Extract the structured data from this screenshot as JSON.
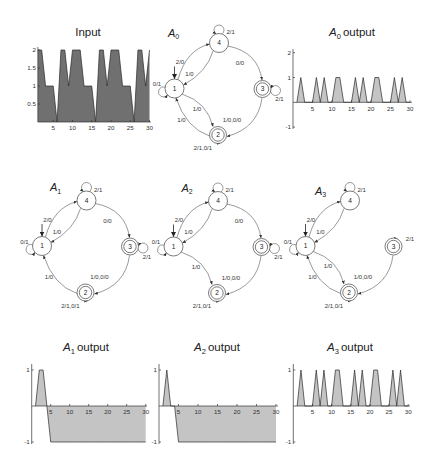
{
  "chart_data": [
    {
      "id": "input",
      "type": "area",
      "title": "Input",
      "title_parts": {
        "text": "Input"
      },
      "xlabel": "",
      "ylabel": "",
      "x": [
        1,
        2,
        3,
        4,
        5,
        6,
        7,
        8,
        9,
        10,
        11,
        12,
        13,
        14,
        15,
        16,
        17,
        18,
        19,
        20,
        21,
        22,
        23,
        24,
        25,
        26,
        27,
        28,
        29,
        30
      ],
      "values": [
        2,
        2,
        1,
        1,
        1,
        0,
        2,
        2,
        1,
        2,
        2,
        2,
        1,
        1,
        1,
        0,
        2,
        2,
        1,
        2,
        2,
        2,
        1,
        1,
        1,
        0,
        2,
        2,
        1,
        2
      ],
      "xlim": [
        1,
        30
      ],
      "ylim": [
        0,
        2
      ],
      "xticks": [
        5,
        10,
        15,
        20,
        25,
        30
      ],
      "xtick_labels": [
        "5",
        "10",
        "15",
        "20",
        "25",
        "30"
      ],
      "yticks": [
        0.5,
        1,
        1.5,
        2
      ],
      "ytick_labels": [
        "0.5",
        "1",
        "1.5",
        "2"
      ],
      "grid": false,
      "fill_color": "#707070"
    },
    {
      "id": "a0-output",
      "type": "area",
      "title": "A0 output",
      "title_parts": {
        "var": "A",
        "sub": "0",
        "text": "output"
      },
      "xlabel": "",
      "ylabel": "",
      "x": [
        1,
        2,
        3,
        4,
        5,
        6,
        7,
        8,
        9,
        10,
        11,
        12,
        13,
        14,
        15,
        16,
        17,
        18,
        19,
        20,
        21,
        22,
        23,
        24,
        25,
        26,
        27,
        28,
        29,
        30
      ],
      "values": [
        0,
        1,
        0,
        0,
        0,
        1,
        0,
        1,
        0,
        0,
        1,
        1,
        0,
        0,
        0,
        1,
        0,
        1,
        0,
        0,
        1,
        1,
        0,
        0,
        0,
        1,
        0,
        1,
        0,
        0
      ],
      "xlim": [
        0,
        30
      ],
      "ylim": [
        -1,
        2
      ],
      "xticks": [
        5,
        10,
        15,
        20,
        25,
        30
      ],
      "xtick_labels": [
        "5",
        "10",
        "15",
        "20",
        "25",
        "30"
      ],
      "yticks": [
        -1,
        1,
        2
      ],
      "ytick_labels": [
        "-1",
        "1",
        "2"
      ],
      "grid": false,
      "fill_color": "#c4c4c4"
    },
    {
      "id": "a1-output",
      "type": "area",
      "title": "A1 output",
      "title_parts": {
        "var": "A",
        "sub": "1",
        "text": "output"
      },
      "xlabel": "",
      "ylabel": "",
      "x": [
        1,
        2,
        3,
        4,
        5,
        6,
        7,
        8,
        9,
        10,
        11,
        12,
        13,
        14,
        15,
        16,
        17,
        18,
        19,
        20,
        21,
        22,
        23,
        24,
        25,
        26,
        27,
        28,
        29,
        30
      ],
      "values": [
        0,
        1,
        1,
        0,
        -1,
        -1,
        -1,
        -1,
        -1,
        -1,
        -1,
        -1,
        -1,
        -1,
        -1,
        -1,
        -1,
        -1,
        -1,
        -1,
        -1,
        -1,
        -1,
        -1,
        -1,
        -1,
        -1,
        -1,
        -1,
        -1
      ],
      "xlim": [
        0,
        30
      ],
      "ylim": [
        -1,
        1
      ],
      "xticks": [
        5,
        10,
        15,
        20,
        25,
        30
      ],
      "xtick_labels": [
        "5",
        "10",
        "15",
        "20",
        "25",
        "30"
      ],
      "yticks": [
        -1,
        1
      ],
      "ytick_labels": [
        "-1",
        "1"
      ],
      "grid": false,
      "fill_color": "#c4c4c4"
    },
    {
      "id": "a2-output",
      "type": "area",
      "title": "A2 output",
      "title_parts": {
        "var": "A",
        "sub": "2",
        "text": "output"
      },
      "xlabel": "",
      "ylabel": "",
      "x": [
        1,
        2,
        3,
        4,
        5,
        6,
        7,
        8,
        9,
        10,
        11,
        12,
        13,
        14,
        15,
        16,
        17,
        18,
        19,
        20,
        21,
        22,
        23,
        24,
        25,
        26,
        27,
        28,
        29,
        30
      ],
      "values": [
        0,
        1,
        0,
        0,
        -1,
        -1,
        -1,
        -1,
        -1,
        -1,
        -1,
        -1,
        -1,
        -1,
        -1,
        -1,
        -1,
        -1,
        -1,
        -1,
        -1,
        -1,
        -1,
        -1,
        -1,
        -1,
        -1,
        -1,
        -1,
        -1
      ],
      "xlim": [
        0,
        30
      ],
      "ylim": [
        -1,
        1
      ],
      "xticks": [
        5,
        10,
        15,
        20,
        25,
        30
      ],
      "xtick_labels": [
        "5",
        "10",
        "15",
        "20",
        "25",
        "30"
      ],
      "yticks": [
        -1,
        1
      ],
      "ytick_labels": [
        "-1",
        "1"
      ],
      "grid": false,
      "fill_color": "#c4c4c4"
    },
    {
      "id": "a3-output",
      "type": "area",
      "title": "A3 output",
      "title_parts": {
        "var": "A",
        "sub": "3",
        "text": "output"
      },
      "xlabel": "",
      "ylabel": "",
      "x": [
        1,
        2,
        3,
        4,
        5,
        6,
        7,
        8,
        9,
        10,
        11,
        12,
        13,
        14,
        15,
        16,
        17,
        18,
        19,
        20,
        21,
        22,
        23,
        24,
        25,
        26,
        27,
        28,
        29,
        30
      ],
      "values": [
        0,
        1,
        0,
        0,
        0,
        1,
        0,
        1,
        0,
        0,
        1,
        1,
        0,
        0,
        0,
        1,
        0,
        1,
        0,
        0,
        1,
        1,
        0,
        0,
        0,
        1,
        0,
        1,
        0,
        0
      ],
      "xlim": [
        0,
        30
      ],
      "ylim": [
        -1,
        1
      ],
      "xticks": [
        5,
        10,
        15,
        20,
        25,
        30
      ],
      "xtick_labels": [
        "5",
        "10",
        "15",
        "20",
        "25",
        "30"
      ],
      "yticks": [
        -1,
        1
      ],
      "ytick_labels": [
        "-1",
        "1"
      ],
      "grid": false,
      "fill_color": "#c4c4c4"
    }
  ],
  "diagrams": [
    {
      "name": "A0",
      "label": {
        "var": "A",
        "sub": "0"
      },
      "states": [
        {
          "id": "1",
          "initial": true,
          "accepting": false
        },
        {
          "id": "2",
          "initial": false,
          "accepting": true
        },
        {
          "id": "3",
          "initial": false,
          "accepting": true
        },
        {
          "id": "4",
          "initial": false,
          "accepting": false
        }
      ],
      "transitions": [
        {
          "from": "1",
          "to": "1",
          "label": "0/1"
        },
        {
          "from": "1",
          "to": "4",
          "label": "2/0"
        },
        {
          "from": "4",
          "to": "1",
          "label": "1/0"
        },
        {
          "from": "4",
          "to": "4",
          "label": "2/1"
        },
        {
          "from": "4",
          "to": "3",
          "label": "0/0"
        },
        {
          "from": "3",
          "to": "3",
          "label": "2/1"
        },
        {
          "from": "1",
          "to": "2",
          "label": "1/0"
        },
        {
          "from": "2",
          "to": "1",
          "label": "1/0"
        },
        {
          "from": "3",
          "to": "2",
          "label": "1/0,0/0"
        },
        {
          "from": "2",
          "to": "2",
          "label": "2/1,0/1"
        }
      ]
    },
    {
      "name": "A1",
      "label": {
        "var": "A",
        "sub": "1"
      },
      "states": [
        {
          "id": "1",
          "initial": true,
          "accepting": false
        },
        {
          "id": "2",
          "initial": false,
          "accepting": true
        },
        {
          "id": "3",
          "initial": false,
          "accepting": true
        },
        {
          "id": "4",
          "initial": false,
          "accepting": false
        }
      ],
      "transitions": [
        {
          "from": "1",
          "to": "1",
          "label": "0/1"
        },
        {
          "from": "1",
          "to": "4",
          "label": "2/0"
        },
        {
          "from": "4",
          "to": "1",
          "label": "1/0"
        },
        {
          "from": "4",
          "to": "4",
          "label": "2/1"
        },
        {
          "from": "4",
          "to": "3",
          "label": "0/0"
        },
        {
          "from": "3",
          "to": "3",
          "label": "2/1"
        },
        {
          "from": "2",
          "to": "1",
          "label": "1/0"
        },
        {
          "from": "3",
          "to": "2",
          "label": "1/0,0/0"
        },
        {
          "from": "2",
          "to": "2",
          "label": "2/1,0/1"
        }
      ]
    },
    {
      "name": "A2",
      "label": {
        "var": "A",
        "sub": "2"
      },
      "states": [
        {
          "id": "1",
          "initial": true,
          "accepting": false
        },
        {
          "id": "2",
          "initial": false,
          "accepting": true
        },
        {
          "id": "3",
          "initial": false,
          "accepting": true
        },
        {
          "id": "4",
          "initial": false,
          "accepting": false
        }
      ],
      "transitions": [
        {
          "from": "1",
          "to": "1",
          "label": "0/1"
        },
        {
          "from": "1",
          "to": "4",
          "label": "2/0"
        },
        {
          "from": "4",
          "to": "1",
          "label": "1/0"
        },
        {
          "from": "4",
          "to": "4",
          "label": "2/1"
        },
        {
          "from": "4",
          "to": "3",
          "label": "0/0"
        },
        {
          "from": "3",
          "to": "3",
          "label": "2/1"
        },
        {
          "from": "1",
          "to": "2",
          "label": "1/0"
        },
        {
          "from": "3",
          "to": "2",
          "label": "1/0,0/0"
        },
        {
          "from": "2",
          "to": "2",
          "label": "2/1,0/1"
        }
      ]
    },
    {
      "name": "A3",
      "label": {
        "var": "A",
        "sub": "3"
      },
      "states": [
        {
          "id": "1",
          "initial": true,
          "accepting": false
        },
        {
          "id": "2",
          "initial": false,
          "accepting": true
        },
        {
          "id": "3",
          "initial": false,
          "accepting": true
        },
        {
          "id": "4",
          "initial": false,
          "accepting": false
        }
      ],
      "transitions": [
        {
          "from": "1",
          "to": "1",
          "label": "0/1"
        },
        {
          "from": "1",
          "to": "4",
          "label": "2/0"
        },
        {
          "from": "4",
          "to": "1",
          "label": "1/0"
        },
        {
          "from": "4",
          "to": "4",
          "label": "2/1"
        },
        {
          "from": "3",
          "to": "3",
          "label": "2/1"
        },
        {
          "from": "1",
          "to": "2",
          "label": "1/0"
        },
        {
          "from": "2",
          "to": "1",
          "label": "1/0"
        },
        {
          "from": "3",
          "to": "2",
          "label": "1/0,0/0"
        },
        {
          "from": "2",
          "to": "2",
          "label": "2/1,0/1"
        }
      ]
    }
  ]
}
